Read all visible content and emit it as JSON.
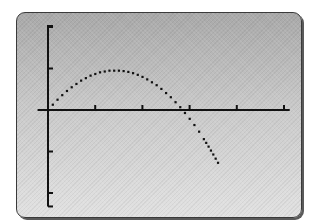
{
  "chart_data": {
    "type": "scatter",
    "title": "",
    "xlabel": "",
    "ylabel": "",
    "x_ticks": [
      1,
      2,
      3,
      4,
      5
    ],
    "y_ticks": [
      -2,
      -1,
      0,
      1,
      2
    ],
    "xlim": [
      -0.2,
      5.1
    ],
    "ylim": [
      -2.3,
      2.0
    ],
    "grid": false,
    "legend": null,
    "series": [
      {
        "name": "y = -0.47x^2 + 1.34x",
        "style": "dots",
        "x": [
          0.0,
          0.1,
          0.2,
          0.3,
          0.4,
          0.5,
          0.6,
          0.7,
          0.8,
          0.9,
          1.0,
          1.1,
          1.2,
          1.3,
          1.4,
          1.5,
          1.6,
          1.7,
          1.8,
          1.9,
          2.0,
          2.1,
          2.2,
          2.3,
          2.4,
          2.5,
          2.6,
          2.7,
          2.8,
          2.9,
          3.0,
          3.1,
          3.2,
          3.3,
          3.4,
          3.5,
          3.6
        ],
        "y": [
          0.0,
          0.13,
          0.25,
          0.36,
          0.46,
          0.55,
          0.63,
          0.71,
          0.77,
          0.83,
          0.87,
          0.91,
          0.93,
          0.95,
          0.95,
          0.95,
          0.94,
          0.92,
          0.89,
          0.85,
          0.8,
          0.74,
          0.67,
          0.6,
          0.51,
          0.41,
          0.31,
          0.19,
          0.07,
          -0.07,
          -0.21,
          -0.36,
          -0.52,
          -0.7,
          -0.88,
          -1.07,
          -1.27
        ]
      }
    ]
  },
  "screen": {
    "background_top": "#a9a9a9",
    "background_bottom": "#e2e2e2",
    "ink_color": "#111111",
    "frame_color": "#3a3a3a"
  }
}
